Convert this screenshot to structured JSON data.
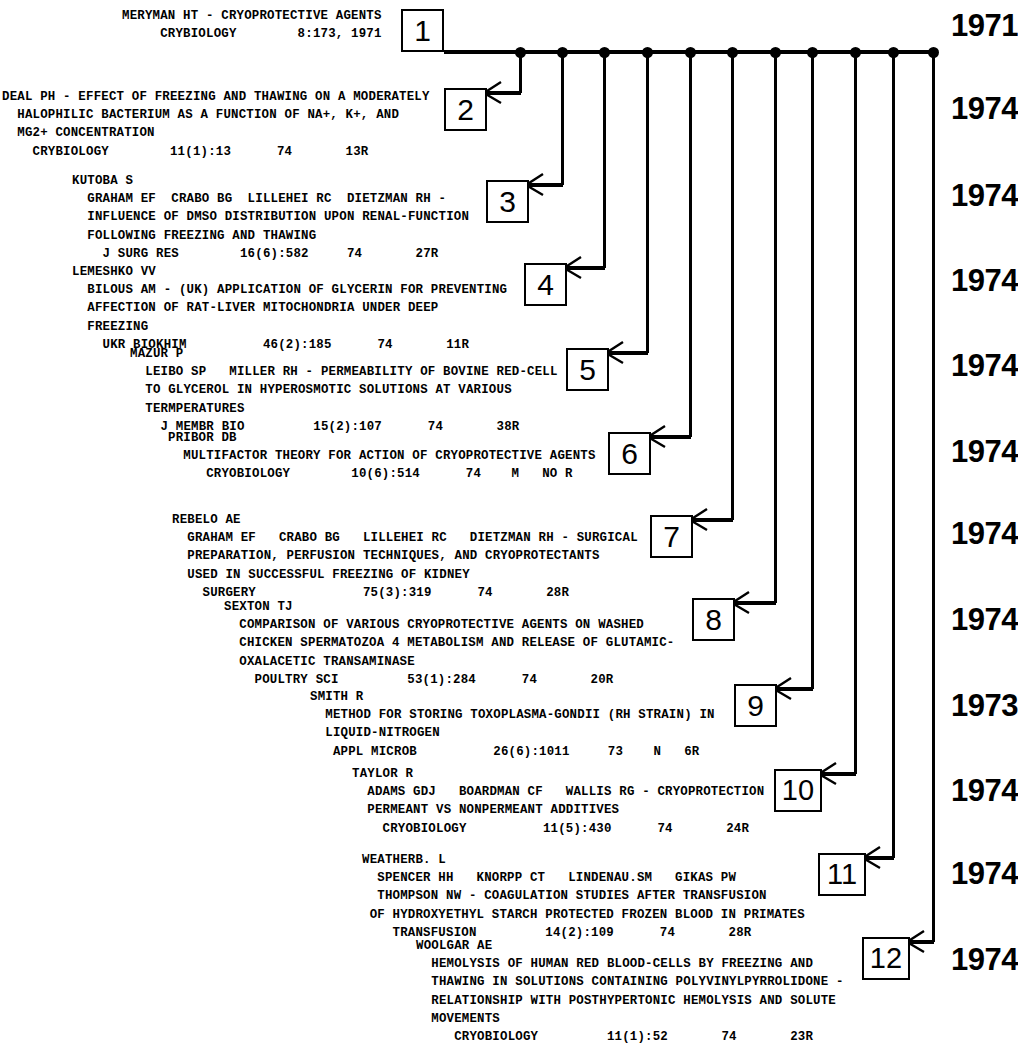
{
  "document": {
    "type": "citation-network-timeline",
    "title_line_1": "MERYMAN HT - CRYOPROTECTIVE AGENTS",
    "title_line_2": "CRYBIOLOGY            8:173, 1971"
  },
  "timeline": {
    "spine_label": "horizontal-timeline-spine",
    "node_count": 12
  },
  "years": [
    "1971",
    "1974",
    "1974",
    "1974",
    "1974",
    "1974",
    "1974",
    "1974",
    "1973",
    "1974",
    "1974",
    "1974"
  ],
  "entries": [
    {
      "number": "1",
      "year": "1971",
      "lines": [
        "MERYMAN HT - CRYOPROTECTIVE AGENTS",
        "     CRYBIOLOGY        8:173, 1971"
      ]
    },
    {
      "number": "2",
      "year": "1974",
      "lines": [
        "DEAL PH - EFFECT OF FREEZING AND THAWING ON A MODERATELY",
        "  HALOPHILIC BACTERIUM AS A FUNCTION OF NA+, K+, AND",
        "  MG2+ CONCENTRATION",
        "    CRYBIOLOGY        11(1):13      74       13R"
      ]
    },
    {
      "number": "3",
      "year": "1974",
      "lines": [
        "KUTOBA S",
        "  GRAHAM EF  CRABO BG  LILLEHEI RC  DIETZMAN RH -",
        "  INFLUENCE OF DMSO DISTRIBUTION UPON RENAL-FUNCTION",
        "  FOLLOWING FREEZING AND THAWING",
        "    J SURG RES        16(6):582     74       27R"
      ]
    },
    {
      "number": "4",
      "year": "1974",
      "lines": [
        "LEMESHKO VV",
        "  BILOUS AM - (UK) APPLICATION OF GLYCERIN FOR PREVENTING",
        "  AFFECTION OF RAT-LIVER MITOCHONDRIA UNDER DEEP",
        "  FREEZING",
        "    UKR BIOKHIM          46(2):185      74       11R"
      ]
    },
    {
      "number": "5",
      "year": "1974",
      "lines": [
        "MAZUR P",
        "  LEIBO SP   MILLER RH - PERMEABILITY OF BOVINE RED-CELL",
        "  TO GLYCEROL IN HYPEROSMOTIC SOLUTIONS AT VARIOUS",
        "  TERMPERATURES",
        "    J MEMBR BIO         15(2):107      74       38R"
      ]
    },
    {
      "number": "6",
      "year": "1974",
      "lines": [
        "PRIBOR DB",
        "  MULTIFACTOR THEORY FOR ACTION OF CRYOPROTECTIVE AGENTS",
        "     CRYOBIOLOGY        10(6):514      74    M   NO R"
      ]
    },
    {
      "number": "7",
      "year": "1974",
      "lines": [
        "REBELO AE",
        "  GRAHAM EF   CRABO BG   LILLEHEI RC   DIETZMAN RH - SURGICAL",
        "  PREPARATION, PERFUSION TECHNIQUES, AND CRYOPROTECTANTS",
        "  USED IN SUCCESSFUL FREEZING OF KIDNEY",
        "    SURGERY              75(3):319      74       28R"
      ]
    },
    {
      "number": "8",
      "year": "1974",
      "lines": [
        "SEXTON TJ",
        "  COMPARISON OF VARIOUS CRYOPROTECTIVE AGENTS ON WASHED",
        "  CHICKEN SPERMATOZOA 4 METABOLISM AND RELEASE OF GLUTAMIC-",
        "  OXALACETIC TRANSAMINASE",
        "    POULTRY SCI         53(1):284      74       20R"
      ]
    },
    {
      "number": "9",
      "year": "1973",
      "lines": [
        "SMITH R",
        "  METHOD FOR STORING TOXOPLASMA-GONDII (RH STRAIN) IN",
        "  LIQUID-NITROGEN",
        "   APPL MICROB          26(6):1011     73    N   6R"
      ]
    },
    {
      "number": "10",
      "year": "1974",
      "lines": [
        "TAYLOR R",
        "  ADAMS GDJ   BOARDMAN CF   WALLIS RG - CRYOPROTECTION",
        "  PERMEANT VS NONPERMEANT ADDITIVES",
        "    CRYOBIOLOGY          11(5):430      74       24R"
      ]
    },
    {
      "number": "11",
      "year": "1974",
      "lines": [
        "WEATHERB. L",
        "  SPENCER HH   KNORPP CT   LINDENAU.SM   GIKAS PW",
        "  THOMPSON NW - COAGULATION STUDIES AFTER TRANSFUSION",
        " OF HYDROXYETHYL STARCH PROTECTED FROZEN BLOOD IN PRIMATES",
        "    TRANSFUSION         14(2):109      74       28R"
      ]
    },
    {
      "number": "12",
      "year": "1974",
      "lines": [
        "WOOLGAR AE",
        "  HEMOLYSIS OF HUMAN RED BLOOD-CELLS BY FREEZING AND",
        "  THAWING IN SOLUTIONS CONTAINING POLYVINYLPYRROLIDONE -",
        "  RELATIONSHIP WITH POSTHYPERTONIC HEMOLYSIS AND SOLUTE",
        "  MOVEMENTS",
        "     CRYOBIOLOGY         11(1):52       74       23R"
      ]
    }
  ],
  "colors": {
    "ink": "#000000",
    "paper": "#ffffff"
  }
}
